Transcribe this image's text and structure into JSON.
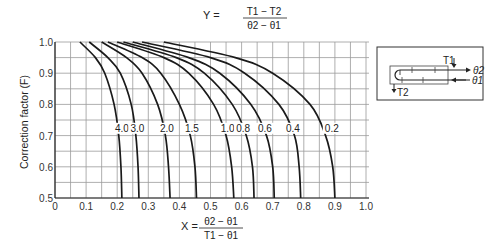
{
  "chart_data": {
    "type": "line",
    "title_parts": {
      "lhs": "Y =",
      "num": "T1 − T2",
      "den": "θ2 − θ1"
    },
    "xlabel": "X = (θ2 − θ1) / (T1 − θ1)",
    "xlabel_parts": {
      "lhs": "X =",
      "num": "θ2 − θ1",
      "den": "T1 − θ1"
    },
    "ylabel": "Correction factor (F)",
    "xlim": [
      0,
      1.0
    ],
    "ylim": [
      0.5,
      1.0
    ],
    "grid": true,
    "x_ticks": [
      "0",
      "0.1",
      "0.2",
      "0.3",
      "0.4",
      "0.5",
      "0.6",
      "0.7",
      "0.8",
      "0.9",
      "1.0"
    ],
    "y_ticks": [
      "0.5",
      "0.6",
      "0.7",
      "0.8",
      "0.9",
      "1.0"
    ],
    "series": [
      {
        "name": "4.0",
        "label_x": 0.215,
        "points": [
          [
            0.08,
            1.0
          ],
          [
            0.13,
            0.95
          ],
          [
            0.16,
            0.9
          ],
          [
            0.19,
            0.8
          ],
          [
            0.205,
            0.7
          ],
          [
            0.212,
            0.6
          ],
          [
            0.215,
            0.5
          ]
        ]
      },
      {
        "name": "3.0",
        "label_x": 0.265,
        "points": [
          [
            0.11,
            1.0
          ],
          [
            0.17,
            0.95
          ],
          [
            0.21,
            0.9
          ],
          [
            0.245,
            0.8
          ],
          [
            0.26,
            0.7
          ],
          [
            0.267,
            0.6
          ],
          [
            0.27,
            0.5
          ]
        ]
      },
      {
        "name": "2.0",
        "label_x": 0.36,
        "points": [
          [
            0.15,
            1.0
          ],
          [
            0.23,
            0.95
          ],
          [
            0.28,
            0.9
          ],
          [
            0.33,
            0.8
          ],
          [
            0.355,
            0.7
          ],
          [
            0.365,
            0.6
          ],
          [
            0.37,
            0.5
          ]
        ]
      },
      {
        "name": "1.5",
        "label_x": 0.44,
        "points": [
          [
            0.17,
            1.0
          ],
          [
            0.28,
            0.95
          ],
          [
            0.34,
            0.9
          ],
          [
            0.4,
            0.8
          ],
          [
            0.435,
            0.7
          ],
          [
            0.45,
            0.6
          ],
          [
            0.455,
            0.5
          ]
        ]
      },
      {
        "name": "1.0",
        "label_x": 0.555,
        "points": [
          [
            0.2,
            1.0
          ],
          [
            0.35,
            0.95
          ],
          [
            0.43,
            0.9
          ],
          [
            0.51,
            0.8
          ],
          [
            0.55,
            0.7
          ],
          [
            0.568,
            0.6
          ],
          [
            0.575,
            0.5
          ]
        ]
      },
      {
        "name": "0.8",
        "label_x": 0.605,
        "points": [
          [
            0.22,
            1.0
          ],
          [
            0.39,
            0.95
          ],
          [
            0.48,
            0.9
          ],
          [
            0.57,
            0.8
          ],
          [
            0.615,
            0.7
          ],
          [
            0.635,
            0.6
          ],
          [
            0.64,
            0.5
          ]
        ]
      },
      {
        "name": "0.6",
        "label_x": 0.675,
        "points": [
          [
            0.25,
            1.0
          ],
          [
            0.43,
            0.95
          ],
          [
            0.53,
            0.9
          ],
          [
            0.63,
            0.8
          ],
          [
            0.68,
            0.7
          ],
          [
            0.7,
            0.6
          ],
          [
            0.705,
            0.5
          ]
        ]
      },
      {
        "name": "0.4",
        "label_x": 0.765,
        "points": [
          [
            0.28,
            1.0
          ],
          [
            0.5,
            0.95
          ],
          [
            0.61,
            0.9
          ],
          [
            0.72,
            0.8
          ],
          [
            0.77,
            0.7
          ],
          [
            0.785,
            0.6
          ],
          [
            0.79,
            0.5
          ]
        ]
      },
      {
        "name": "0.2",
        "label_x": 0.89,
        "points": [
          [
            0.35,
            1.0
          ],
          [
            0.58,
            0.95
          ],
          [
            0.7,
            0.9
          ],
          [
            0.82,
            0.8
          ],
          [
            0.87,
            0.7
          ],
          [
            0.893,
            0.6
          ],
          [
            0.9,
            0.5
          ]
        ]
      }
    ],
    "label_row_F": 0.725,
    "inset": {
      "labels": {
        "t1": "T1",
        "t2": "T2",
        "th1": "θ1",
        "th2": "θ2"
      },
      "description": "1 shell pass, 2 tube passes schematic"
    }
  }
}
